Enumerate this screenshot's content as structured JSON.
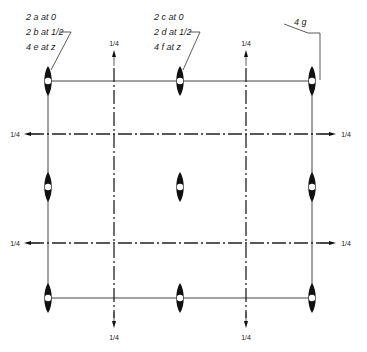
{
  "diagram": {
    "colors": {
      "line": "#333333",
      "axis": "#111111",
      "background": "#ffffff"
    },
    "labels": {
      "corner": {
        "line1": "2 a at 0",
        "line2": "2 b at 1/2",
        "line3": "4 e at z"
      },
      "center": {
        "line1": "2 c at 0",
        "line2": "2 d at 1/2",
        "line3": "4 f at z"
      },
      "general": "4 g"
    },
    "fractions": {
      "top_left": "1/4",
      "top_right": "1/4",
      "bottom_left": "1/4",
      "bottom_right": "1/4",
      "left_upper": "1/4",
      "left_lower": "1/4",
      "right_upper": "1/4",
      "right_lower": "1/4"
    },
    "grid": {
      "solid_x": [
        48,
        180,
        312
      ],
      "solid_y": [
        81,
        187,
        298
      ],
      "dashed_x": [
        114,
        246
      ],
      "dashed_y": [
        134,
        243
      ]
    },
    "twofold_axes": [
      {
        "x": 48,
        "y": 81
      },
      {
        "x": 180,
        "y": 81
      },
      {
        "x": 312,
        "y": 81
      },
      {
        "x": 48,
        "y": 187
      },
      {
        "x": 180,
        "y": 187
      },
      {
        "x": 312,
        "y": 187
      },
      {
        "x": 48,
        "y": 298
      },
      {
        "x": 180,
        "y": 298
      },
      {
        "x": 312,
        "y": 298
      }
    ]
  }
}
